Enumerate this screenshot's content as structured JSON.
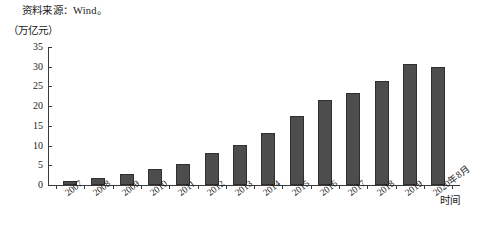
{
  "source_note": "资料来源：Wind。",
  "y_unit_label": "（万亿元）",
  "x_axis_title": "时间",
  "colors": {
    "bar_fill": "#4d4d4d",
    "bar_edge": "#2f2f2f",
    "axis": "#3b3b3b",
    "background": "#ffffff",
    "text": "#1a1a1a"
  },
  "chart_data": {
    "type": "bar",
    "title": "",
    "subtitle": "",
    "xlabel": "时间",
    "ylabel": "（万亿元）",
    "categories": [
      "2007",
      "2008",
      "2009",
      "2010",
      "2011",
      "2012",
      "2013",
      "2014",
      "2015",
      "2016",
      "2017",
      "2018",
      "2019",
      "2020年8月"
    ],
    "values": [
      1.1,
      1.7,
      2.9,
      4.0,
      5.4,
      8.1,
      10.1,
      13.2,
      17.5,
      21.6,
      23.4,
      26.5,
      30.6,
      29.9
    ],
    "ylim": [
      0,
      35
    ],
    "ytick_labels": [
      "0",
      "5",
      "10",
      "15",
      "20",
      "25",
      "30",
      "35"
    ],
    "ytick_values": [
      0,
      5,
      10,
      15,
      20,
      25,
      30,
      35
    ],
    "grid": false,
    "legend": false,
    "legend_position": "none",
    "annotations": [
      "资料来源：Wind。"
    ]
  }
}
